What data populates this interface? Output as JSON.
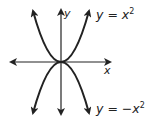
{
  "diagram": {
    "type": "coordinate-graph",
    "axes": {
      "x_label": "x",
      "y_label": "y",
      "origin_px": [
        61,
        62
      ]
    },
    "curves": [
      {
        "name": "upward-parabola",
        "label_var": "y",
        "label_eq": "=",
        "label_rhs": "x",
        "label_exp": "2",
        "full_label": "y = x^2",
        "opens": "up"
      },
      {
        "name": "downward-parabola",
        "label_var": "y",
        "label_eq": "=",
        "label_rhs": "−x",
        "label_exp": "2",
        "full_label": "y = -x^2",
        "opens": "down"
      }
    ],
    "colors": {
      "line": "#222222",
      "background": "#ffffff"
    }
  }
}
